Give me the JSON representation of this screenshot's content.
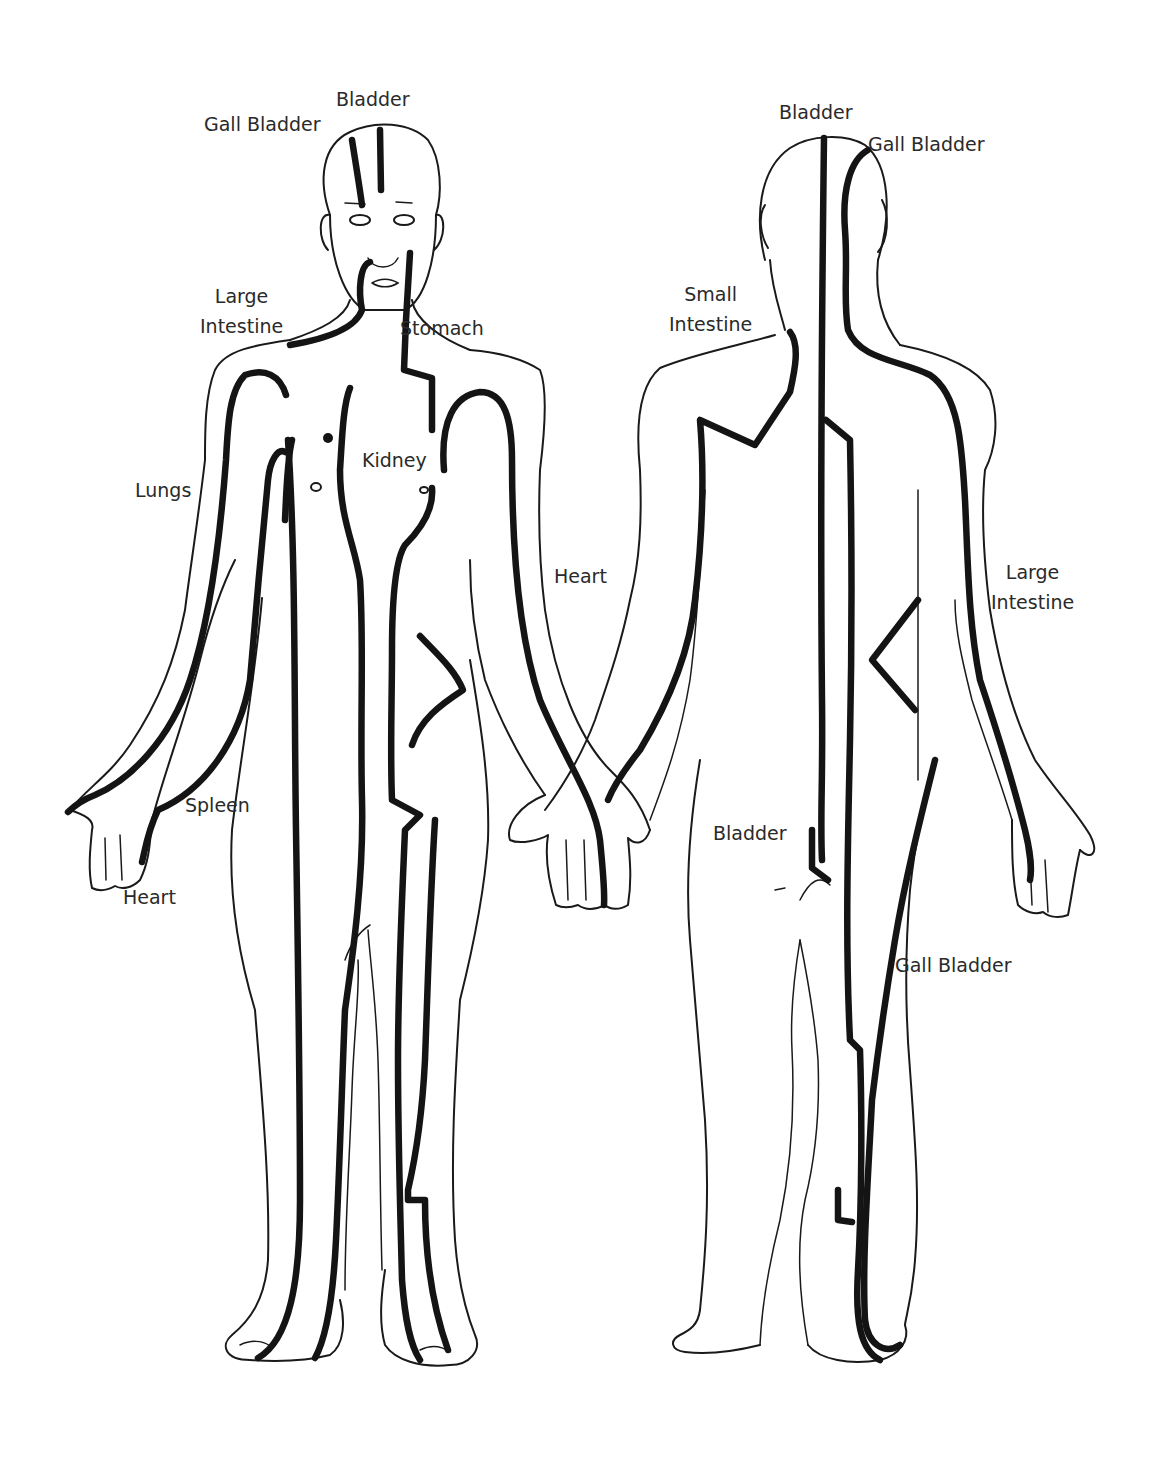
{
  "diagram": {
    "colors": {
      "line": "#141414",
      "text": "#2a2a2a",
      "background": "#ffffff"
    },
    "front_view": {
      "labels": [
        {
          "id": "bladder",
          "lines": [
            "Bladder"
          ]
        },
        {
          "id": "gall-bladder",
          "lines": [
            "Gall Bladder"
          ]
        },
        {
          "id": "large-intestine",
          "lines": [
            "Large",
            "Intestine"
          ]
        },
        {
          "id": "stomach",
          "lines": [
            "Stomach"
          ]
        },
        {
          "id": "kidney",
          "lines": [
            "Kidney"
          ]
        },
        {
          "id": "lungs",
          "lines": [
            "Lungs"
          ]
        },
        {
          "id": "heart-arm",
          "lines": [
            "Heart"
          ]
        },
        {
          "id": "spleen",
          "lines": [
            "Spleen"
          ]
        },
        {
          "id": "heart-hand",
          "lines": [
            "Heart"
          ]
        }
      ]
    },
    "back_view": {
      "labels": [
        {
          "id": "bladder",
          "lines": [
            "Bladder"
          ]
        },
        {
          "id": "gall-bladder",
          "lines": [
            "Gall Bladder"
          ]
        },
        {
          "id": "small-intestine",
          "lines": [
            "Small",
            "Intestine"
          ]
        },
        {
          "id": "large-intestine",
          "lines": [
            "Large",
            "Intestine"
          ]
        },
        {
          "id": "bladder-leg",
          "lines": [
            "Bladder"
          ]
        },
        {
          "id": "gall-bladder-leg",
          "lines": [
            "Gall Bladder"
          ]
        }
      ]
    }
  }
}
